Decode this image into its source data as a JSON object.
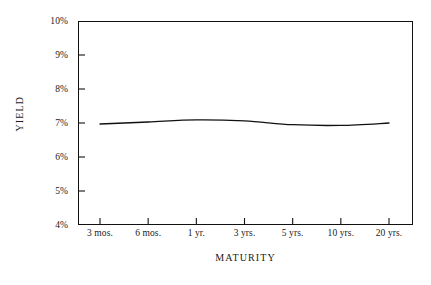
{
  "chart_data": {
    "type": "line",
    "title": "",
    "xlabel": "MATURITY",
    "ylabel": "YIELD",
    "categories": [
      "3 mos.",
      "6 mos.",
      "1 yr.",
      "3 yrs.",
      "5 yrs.",
      "10 yrs.",
      "20 yrs."
    ],
    "x_tick_labels": [
      "3 mos.",
      "6 mos.",
      "1 yr.",
      "3 yrs.",
      "5 yrs.",
      "10 yrs.",
      "20 yrs."
    ],
    "y_tick_labels": [
      "10%",
      "9%",
      "8%",
      "7%",
      "6%",
      "5%",
      "4%"
    ],
    "y_tick_values": [
      10,
      9,
      8,
      7,
      6,
      5,
      4
    ],
    "ylim": [
      4,
      10
    ],
    "xlim": [
      0,
      6
    ],
    "grid": false,
    "legend": "none",
    "series": [
      {
        "name": "Yield curve",
        "color": "#111111",
        "values": [
          6.97,
          7.03,
          7.09,
          7.06,
          6.95,
          6.93,
          7.0
        ]
      }
    ],
    "annotations": []
  },
  "axes": {
    "y_title": "YIELD",
    "x_title": "MATURITY"
  },
  "style": {
    "line_color": "#111111",
    "frame_color": "#111111",
    "background": "#ffffff"
  }
}
